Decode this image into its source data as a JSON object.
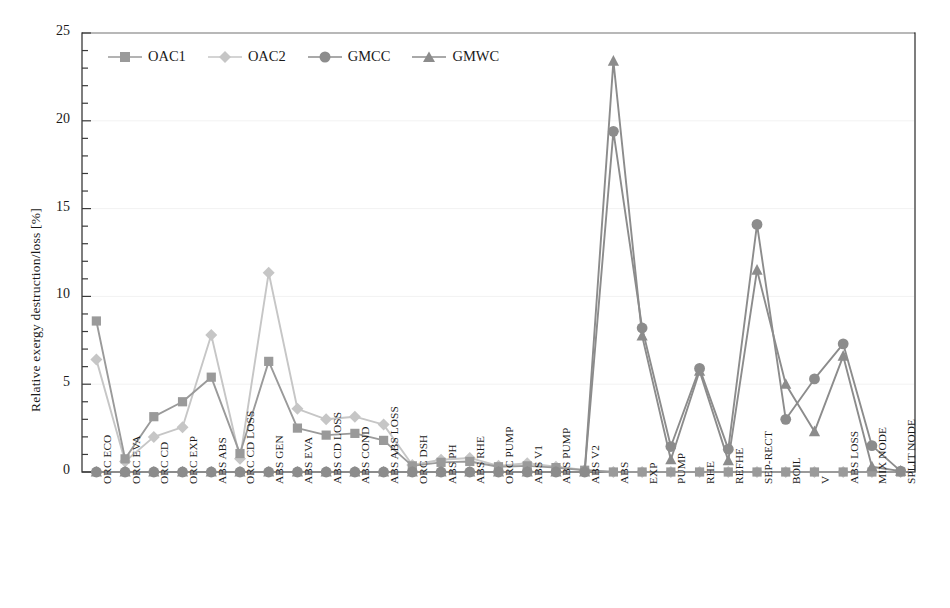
{
  "chart_data": {
    "type": "line",
    "title": "",
    "xlabel": "",
    "ylabel": "Relative exergy destruction/loss [%]",
    "ylim": [
      0,
      25
    ],
    "ytick_values": [
      0,
      5,
      10,
      15,
      20,
      25
    ],
    "ytick_labels": [
      "0",
      "5",
      "10",
      "15",
      "20",
      "25"
    ],
    "y_minor_tick_step": 1,
    "grid": false,
    "legend_position": "top-left inside",
    "categories": [
      "ORC ECO",
      "ORC EVA",
      "ORC CD",
      "ORC EXP",
      "ABS ABS",
      "ORC CD LOSS",
      "ABS GEN",
      "ABS EVA",
      "ABS CD LOSS",
      "ABS COND",
      "ABS ABS LOSS",
      "ORC DSH",
      "ABS PH",
      "ABS RHE",
      "ORC PUMP",
      "ABS V1",
      "ABS PUMP",
      "ABS V2",
      "ABS",
      "EXP",
      "PUMP",
      "RHE",
      "REFHE",
      "SEP-RECT",
      "BOIL",
      "V",
      "ABS LOSS",
      "MIX NODE",
      "SPLIT NODE"
    ],
    "series": [
      {
        "name": "OAC1",
        "marker": "square",
        "color": "#9a9a9a",
        "values": [
          8.6,
          0.75,
          3.15,
          4.0,
          5.4,
          1.05,
          6.3,
          2.5,
          2.1,
          2.2,
          1.8,
          0.35,
          0.55,
          0.6,
          0.3,
          0.35,
          0.25,
          0.1,
          0,
          0,
          0,
          0,
          0,
          0,
          0,
          0,
          0,
          0,
          0
        ]
      },
      {
        "name": "OAC2",
        "marker": "diamond",
        "color": "#c6c6c6",
        "values": [
          6.4,
          0.6,
          2.0,
          2.55,
          7.8,
          0.75,
          11.35,
          3.6,
          3.0,
          3.15,
          2.7,
          0.4,
          0.7,
          0.8,
          0.35,
          0.5,
          0.3,
          0.12,
          0,
          0,
          0,
          0,
          0,
          0,
          0,
          0,
          0,
          0,
          0
        ]
      },
      {
        "name": "GMCC",
        "marker": "circle",
        "color": "#8c8c8c",
        "values": [
          0,
          0,
          0,
          0,
          0,
          0,
          0,
          0,
          0,
          0,
          0,
          0,
          0,
          0,
          0,
          0,
          0,
          0,
          19.4,
          8.2,
          1.45,
          5.9,
          1.3,
          14.1,
          3.0,
          5.3,
          7.3,
          1.5,
          0.05
        ]
      },
      {
        "name": "GMWC",
        "marker": "triangle",
        "color": "#8c8c8c",
        "values": [
          0,
          0,
          0,
          0,
          0,
          0,
          0,
          0,
          0,
          0,
          0,
          0,
          0,
          0,
          0,
          0,
          0,
          0,
          23.4,
          7.75,
          0.7,
          5.75,
          0.65,
          11.5,
          5.0,
          2.3,
          6.6,
          0.3,
          0.05
        ]
      }
    ]
  },
  "legend": {
    "items": [
      {
        "label": "OAC1"
      },
      {
        "label": "OAC2"
      },
      {
        "label": "GMCC"
      },
      {
        "label": "GMWC"
      }
    ]
  }
}
